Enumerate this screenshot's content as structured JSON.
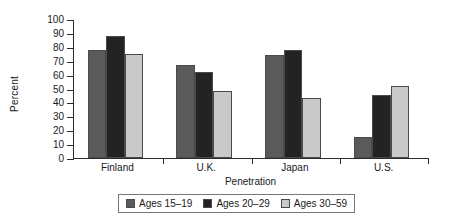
{
  "chart_data": {
    "type": "bar",
    "title": "",
    "xlabel": "Penetration",
    "ylabel": "Percent",
    "categories": [
      "Finland",
      "U.K.",
      "Japan",
      "U.S."
    ],
    "series": [
      {
        "name": "Ages 15–19",
        "color": "#5a5a5a",
        "values": [
          78,
          67,
          74,
          15
        ]
      },
      {
        "name": "Ages 20–29",
        "color": "#232323",
        "values": [
          88,
          62,
          78,
          45
        ]
      },
      {
        "name": "Ages 30–59",
        "color": "#c9c9c9",
        "values": [
          75,
          48,
          43,
          52
        ]
      }
    ],
    "ylim": [
      0,
      100
    ],
    "yticks": [
      100,
      90,
      80,
      70,
      60,
      50,
      40,
      30,
      20,
      10,
      0
    ],
    "ytick_labels": [
      "100",
      "90",
      "80",
      "70",
      "60",
      "50",
      "40",
      "30",
      "20",
      "10",
      "0"
    ],
    "grid": false,
    "legend_position": "bottom-center",
    "axis_color": "#2b2b2b",
    "background": "#ffffff"
  }
}
